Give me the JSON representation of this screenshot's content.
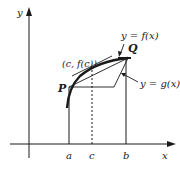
{
  "diagram": {
    "axes": {
      "x_label": "x",
      "y_label": "y"
    },
    "points": {
      "P": "P",
      "Q": "Q",
      "tangent_point": "(c, f(c))"
    },
    "ticks": {
      "a": "a",
      "c": "c",
      "b": "b"
    },
    "curves": {
      "f_label": "y = f(x)",
      "g_label": "y = g(x)"
    },
    "colors": {
      "ink": "#1a1a1a",
      "background": "#ffffff"
    }
  }
}
